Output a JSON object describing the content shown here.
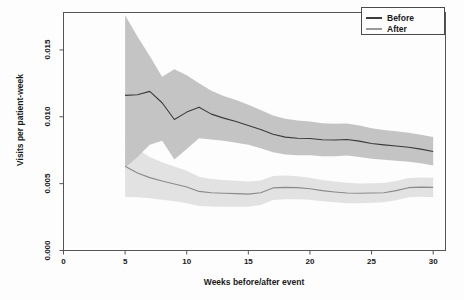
{
  "chart_data": {
    "type": "line",
    "title": "",
    "xlabel": "Weeks before/after event",
    "ylabel": "Visits per patient-week",
    "xlim": [
      0,
      31
    ],
    "ylim": [
      0.0,
      0.0178
    ],
    "xticks": [
      0,
      5,
      10,
      15,
      20,
      25,
      30
    ],
    "xtick_labels": [
      "0",
      "5",
      "10",
      "15",
      "20",
      "25",
      "30"
    ],
    "yticks": [
      0.0,
      0.005,
      0.01,
      0.015
    ],
    "ytick_labels": [
      "0.000",
      "0.005",
      "0.010",
      "0.015"
    ],
    "grid": false,
    "legend_position": "top-right",
    "legend_entries": [
      "Before",
      "After"
    ],
    "x": [
      5,
      6,
      7,
      8,
      9,
      10,
      11,
      12,
      13,
      14,
      15,
      16,
      17,
      18,
      19,
      20,
      21,
      22,
      23,
      24,
      25,
      26,
      27,
      28,
      29,
      30
    ],
    "series": [
      {
        "name": "Before",
        "color": "#3b3b3b",
        "band_color": "#c4c4c4",
        "values": [
          0.0116,
          0.01165,
          0.0119,
          0.01105,
          0.0098,
          0.01035,
          0.01072,
          0.0102,
          0.0099,
          0.00965,
          0.00935,
          0.00905,
          0.0087,
          0.00848,
          0.0084,
          0.00838,
          0.00828,
          0.00826,
          0.0083,
          0.00818,
          0.008,
          0.0079,
          0.00782,
          0.00772,
          0.00758,
          0.0074
        ],
        "band_upper": [
          0.0176,
          0.016,
          0.01455,
          0.013,
          0.01355,
          0.0131,
          0.0125,
          0.01195,
          0.01155,
          0.01125,
          0.0109,
          0.0105,
          0.0101,
          0.00985,
          0.00972,
          0.00965,
          0.00952,
          0.00948,
          0.0095,
          0.00935,
          0.00915,
          0.00902,
          0.00892,
          0.0088,
          0.00865,
          0.00848
        ],
        "band_lower": [
          0.0062,
          0.007,
          0.0079,
          0.0082,
          0.0068,
          0.0076,
          0.0084,
          0.0083,
          0.0082,
          0.00805,
          0.0079,
          0.00765,
          0.00735,
          0.00718,
          0.00712,
          0.00712,
          0.00705,
          0.00705,
          0.0071,
          0.007,
          0.00686,
          0.00678,
          0.00672,
          0.00664,
          0.00652,
          0.00636
        ]
      },
      {
        "name": "After",
        "color": "#8a8a8a",
        "band_color": "#e2e2e2",
        "values": [
          0.0063,
          0.0058,
          0.00545,
          0.0052,
          0.00498,
          0.00475,
          0.00442,
          0.00432,
          0.00428,
          0.00425,
          0.00422,
          0.00432,
          0.00468,
          0.00472,
          0.0047,
          0.00462,
          0.00448,
          0.00438,
          0.0043,
          0.00428,
          0.0043,
          0.00432,
          0.00448,
          0.0047,
          0.00474,
          0.00472
        ],
        "band_upper": [
          0.00858,
          0.0076,
          0.007,
          0.0066,
          0.00628,
          0.00596,
          0.00552,
          0.00535,
          0.00528,
          0.00522,
          0.00516,
          0.00524,
          0.00558,
          0.0056,
          0.00556,
          0.00545,
          0.00528,
          0.00516,
          0.00506,
          0.00502,
          0.00503,
          0.00504,
          0.0052,
          0.00542,
          0.00546,
          0.00545
        ],
        "band_lower": [
          0.004,
          0.00398,
          0.0039,
          0.0038,
          0.00368,
          0.00354,
          0.00332,
          0.00329,
          0.00328,
          0.00328,
          0.00328,
          0.0034,
          0.00378,
          0.00384,
          0.00384,
          0.00379,
          0.00368,
          0.0036,
          0.00354,
          0.00354,
          0.00357,
          0.0036,
          0.00376,
          0.00398,
          0.00402,
          0.00399
        ]
      }
    ]
  },
  "legend": {
    "before_label": "Before",
    "after_label": "After"
  },
  "axes": {
    "x_title": "Weeks before/after event",
    "y_title": "Visits per patient-week"
  }
}
